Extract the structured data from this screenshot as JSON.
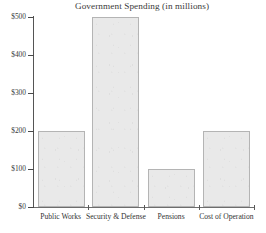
{
  "chart_data": {
    "type": "bar",
    "title": "Government Spending (in millions)",
    "xlabel": "",
    "ylabel": "",
    "categories": [
      "Public Works",
      "Security & Defense",
      "Pensions",
      "Cost of Operation"
    ],
    "values": [
      200,
      500,
      100,
      200
    ],
    "value_labels": [
      "$200",
      "$500",
      "$100",
      "$200"
    ],
    "ytick_labels": [
      "$0",
      "$100",
      "$200",
      "$300",
      "$400",
      "$500"
    ],
    "ytick_values": [
      0,
      100,
      200,
      300,
      400,
      500
    ],
    "ylim": [
      0,
      500
    ],
    "grid": false,
    "legend": false,
    "legend_position": "none",
    "bar_fill_color": "#e9e9e9",
    "bar_border_color": "#b4b4b4",
    "axis_color": "#555555",
    "text_color": "#333333",
    "background_color": "#ffffff"
  },
  "axes": {
    "y": {
      "ticks": [
        {
          "label": "$500",
          "value": 500
        },
        {
          "label": "$400",
          "value": 400
        },
        {
          "label": "$300",
          "value": 300
        },
        {
          "label": "$200",
          "value": 200
        },
        {
          "label": "$100",
          "value": 100
        },
        {
          "label": "$0",
          "value": 0
        }
      ]
    },
    "x": {
      "ticks": [
        {
          "label": "Public Works"
        },
        {
          "label": "Security & Defense"
        },
        {
          "label": "Pensions"
        },
        {
          "label": "Cost of Operation"
        }
      ]
    }
  }
}
